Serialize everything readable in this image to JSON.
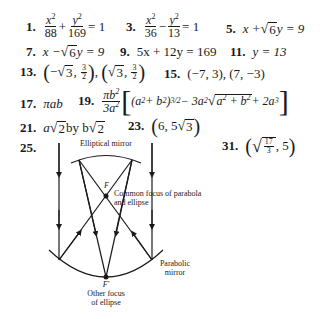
{
  "answers": {
    "a1": {
      "num": "1.",
      "lhs_x_num": "x",
      "x_den": "88",
      "plus": "+",
      "y_num": "y",
      "y_den": "169",
      "rhs": "= 1"
    },
    "a3": {
      "num": "3.",
      "x_num": "x",
      "x_den": "36",
      "minus": "−",
      "y_num": "y",
      "y_den": "13",
      "rhs": "= 1"
    },
    "a5": {
      "num": "5.",
      "pre": "x + ",
      "rad": "6",
      "post": "y = 9"
    },
    "a7": {
      "num": "7.",
      "pre": "x − ",
      "rad": "6",
      "post": "y = 9"
    },
    "a9": {
      "num": "9.",
      "text": "5x + 12y = 169"
    },
    "a11": {
      "num": "11.",
      "text": "y = 13"
    },
    "a13": {
      "num": "13.",
      "p1_sign": "−",
      "p1_rad": "3",
      "frac_n": "3",
      "frac_d": "2",
      "p2_rad": "3",
      "sep": ","
    },
    "a15": {
      "num": "15.",
      "text": "(−7, 3), (7, −3)"
    },
    "a17": {
      "num": "17.",
      "text": "πab"
    },
    "a19": {
      "num": "19.",
      "coef_num": "πb",
      "coef_den": "3a",
      "t1": "(a",
      "t1b": " + b",
      "t1c": ")",
      "exp1": "3/2",
      "t2": " − 3a",
      "t3_rad": "a",
      "t3_rad_b": " + b",
      "t4": " + 2a",
      "exp2": "2",
      "exp3": "3"
    },
    "a21": {
      "num": "21.",
      "pre": "a",
      "rad1": "2",
      "mid": " by b",
      "rad2": "2"
    },
    "a23": {
      "num": "23.",
      "first": "6, 5",
      "rad": "3"
    },
    "a25": {
      "num": "25."
    },
    "a31": {
      "num": "31.",
      "frac_n": "17",
      "frac_d": "3",
      "second": ", 5"
    }
  },
  "diagram": {
    "elliptical_mirror_label": "Elliptical mirror",
    "focus_label": "F",
    "focus_caption_line1": "Common focus of parabola",
    "focus_caption_line2": "and ellipse",
    "parabolic_label_line1": "Parabolic",
    "parabolic_label_line2": "mirror",
    "other_focus_label": "F′",
    "other_focus_caption_line1": "Other focus",
    "other_focus_caption_line2": "of ellipse"
  }
}
